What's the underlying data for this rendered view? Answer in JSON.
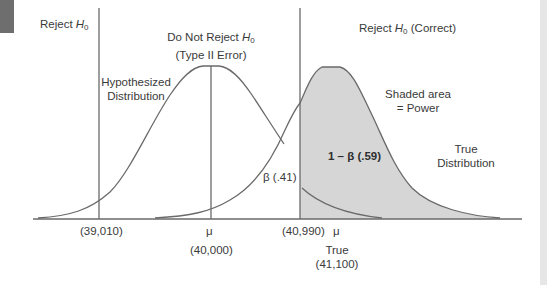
{
  "regions": {
    "left_reject": {
      "text": "Reject ",
      "var": "H",
      "sub": "0"
    },
    "do_not_reject": {
      "line1_text": "Do Not Reject ",
      "line1_var": "H",
      "line1_sub": "0",
      "line2": "(Type II Error)"
    },
    "right_reject": {
      "text": "Reject ",
      "var": "H",
      "sub": "0",
      "suffix": " (Correct)"
    }
  },
  "annotations": {
    "hypothesized_line1": "Hypothesized",
    "hypothesized_line2": "Distribution",
    "shaded_line1": "Shaded area",
    "shaded_line2": "= Power",
    "true_line1": "True",
    "true_line2": "Distribution",
    "power_label": "1 – β  (.59)",
    "beta_label": "β (.41)"
  },
  "axis": {
    "lower_critical": "(39,010)",
    "mu_symbol": "μ",
    "mu_value": "(40,000)",
    "upper_critical": "(40,990)",
    "true_mu_symbol": "μ",
    "true_label": "True",
    "true_value": "(41,100)"
  },
  "colors": {
    "line": "#6a6a6a",
    "shade": "#d6d6d6",
    "text": "#3a3a3a"
  }
}
